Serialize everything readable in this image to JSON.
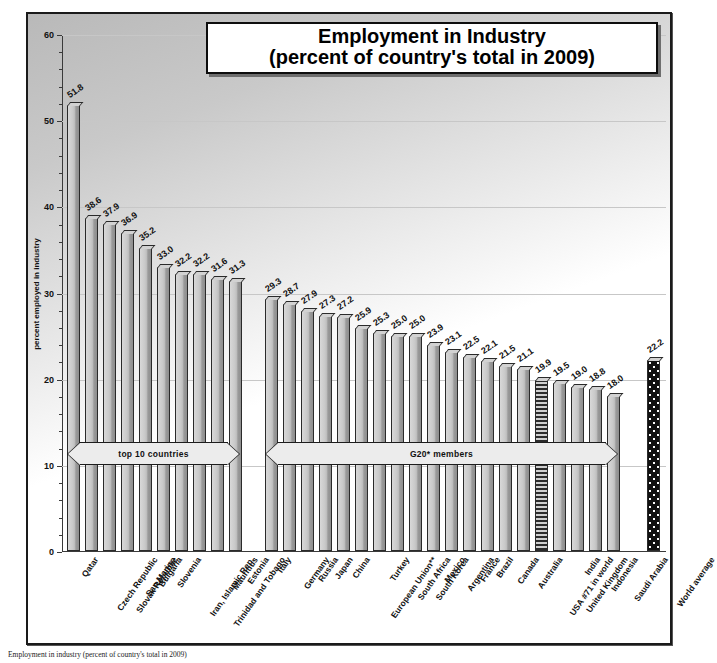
{
  "title": {
    "line1": "Employment in Industry",
    "line2": "(percent of country's total in 2009)"
  },
  "axis": {
    "y_title": "percent employed in industry",
    "ticks": [
      "0",
      "10",
      "20",
      "30",
      "40",
      "50",
      "60"
    ],
    "y_min": 0,
    "y_max": 60
  },
  "groups": {
    "top10_label": "top 10 countries",
    "g20_label": "G20* members"
  },
  "caption": "Employment in industry (percent of country's total in 2009)",
  "chart_data": {
    "type": "bar",
    "title": "Employment in Industry (percent of country's total in 2009)",
    "xlabel": "",
    "ylabel": "percent employed in industry",
    "ylim": [
      0,
      60
    ],
    "ytick_step": 10,
    "grid": true,
    "legend": "none",
    "categories": [
      "Qatar",
      "Czech Republic",
      "Slovak Republic",
      "San Marino",
      "Bulgaria",
      "Slovenia",
      "Iran, Islamic Rep.",
      "Trinidad and Tobago",
      "Mauritius",
      "Estonia",
      "Italy",
      "Germany",
      "Russia",
      "Japan",
      "China",
      "European Union**",
      "Turkey",
      "South Africa",
      "South Korea",
      "Mexico",
      "Argentina",
      "France",
      "Brazil",
      "Canada",
      "Australia",
      "USA #71 in world",
      "United Kingdom",
      "India",
      "Indonesia",
      "Saudi Arabia",
      "World average"
    ],
    "values": [
      51.8,
      38.6,
      37.9,
      36.9,
      35.2,
      33.0,
      32.2,
      32.2,
      31.6,
      31.3,
      29.3,
      28.7,
      27.9,
      27.3,
      27.2,
      25.9,
      25.3,
      25.0,
      25.0,
      23.9,
      23.1,
      22.5,
      22.1,
      21.5,
      21.1,
      19.9,
      19.5,
      19.0,
      18.8,
      18.0,
      22.2
    ],
    "value_labels": [
      "51.8",
      "38.6",
      "37.9",
      "36.9",
      "35.2",
      "33.0",
      "32.2",
      "32.2",
      "31.6",
      "31.3",
      "29.3",
      "28.7",
      "27.9",
      "27.3",
      "27.2",
      "25.9",
      "25.3",
      "25.0",
      "25.0",
      "23.9",
      "23.1",
      "22.5",
      "22.1",
      "21.5",
      "21.1",
      "19.9",
      "19.5",
      "19.0",
      "18.8",
      "18.0",
      "22.2"
    ],
    "highlight": {
      "USA #71 in world": "striped",
      "World average": "checkered"
    },
    "annotations": [
      {
        "text": "top 10 countries",
        "covers": [
          "Qatar",
          "Estonia"
        ]
      },
      {
        "text": "G20* members",
        "covers": [
          "Italy",
          "Saudi Arabia"
        ]
      }
    ]
  },
  "colors": {
    "bar": "#c9c9c9",
    "bar_edge": "#2a2a2a",
    "highlight_dark": "#111111",
    "grid": "#c7c7c7",
    "frame": "#1a1a1a"
  }
}
